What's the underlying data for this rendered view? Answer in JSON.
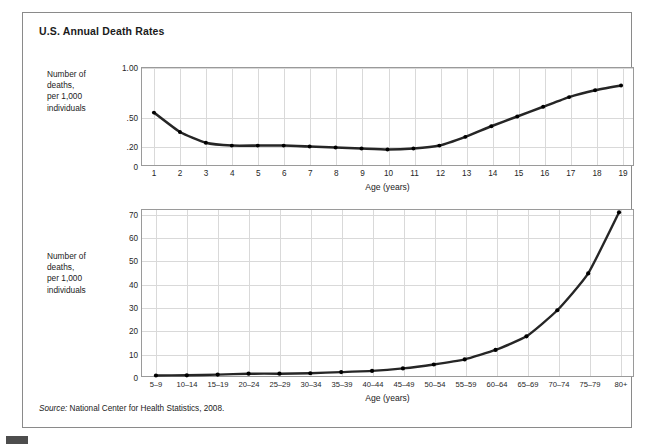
{
  "figure": {
    "title": "U.S. Annual Death Rates",
    "source_prefix": "Source:",
    "source_text": " National Center for Health Statistics, 2008."
  },
  "chart_data": [
    {
      "type": "line",
      "id": "top",
      "title": "U.S. Annual Death Rates",
      "ylabel": "Number of\ndeaths,\nper 1,000\nindividuals",
      "xlabel": "Age (years)",
      "categories": [
        "1",
        "2",
        "3",
        "4",
        "5",
        "6",
        "7",
        "8",
        "9",
        "10",
        "11",
        "12",
        "13",
        "14",
        "15",
        "16",
        "17",
        "18",
        "19"
      ],
      "values": [
        0.54,
        0.34,
        0.23,
        0.2,
        0.2,
        0.2,
        0.19,
        0.18,
        0.17,
        0.16,
        0.17,
        0.2,
        0.29,
        0.4,
        0.5,
        0.6,
        0.7,
        0.77,
        0.82
      ],
      "ytick_labels": [
        "1.00",
        ".50",
        ".20",
        "0"
      ],
      "ytick_values": [
        1.0,
        0.5,
        0.2,
        0.0
      ],
      "ylim": [
        0,
        1.0
      ],
      "grid": true,
      "legend": "none",
      "marker": "dot"
    },
    {
      "type": "line",
      "id": "bottom",
      "ylabel": "Number of\ndeaths,\nper 1,000\nindividuals",
      "xlabel": "Age (years)",
      "categories": [
        "5–9",
        "10–14",
        "15–19",
        "20–24",
        "25–29",
        "30–34",
        "35–39",
        "40–44",
        "45–49",
        "50–54",
        "55–59",
        "60–64",
        "65–69",
        "70–74",
        "75–79",
        "80+"
      ],
      "values": [
        0.2,
        0.3,
        0.6,
        1.0,
        1.0,
        1.2,
        1.7,
        2.2,
        3.3,
        5.0,
        7.2,
        11.3,
        17.2,
        28.5,
        44.5,
        71.0
      ],
      "ytick_labels": [
        "0",
        "10",
        "20",
        "30",
        "40",
        "50",
        "60",
        "70"
      ],
      "ytick_values": [
        0,
        10,
        20,
        30,
        40,
        50,
        60,
        70
      ],
      "ylim": [
        0,
        72
      ],
      "grid": true,
      "legend": "none",
      "marker": "dot"
    }
  ],
  "colors": {
    "series_line": "#262626",
    "frame": "#8a8a8a",
    "grid": "#d9d9d9",
    "text": "#1b1b1b"
  }
}
